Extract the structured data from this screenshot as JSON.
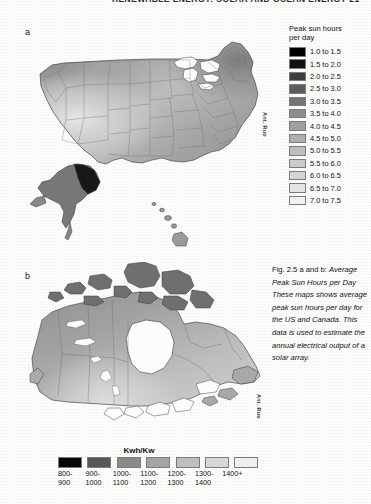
{
  "page": {
    "running_head": "RENEWABLE ENERGY: SOLAR AND OCEAN ENERGY   21",
    "panel_a_label": "a",
    "panel_b_label": "b",
    "attribution_a": "Ant. Ruo",
    "attribution_b": "Ant. Ruo"
  },
  "legend_a": {
    "title_line1": "Peak sun hours",
    "title_line2": "per day",
    "items": [
      {
        "label": "1.0 to 1.5",
        "color": "#000000"
      },
      {
        "label": "1.5 to 2.0",
        "color": "#111111"
      },
      {
        "label": "2.0 to 2.5",
        "color": "#3d3d3d"
      },
      {
        "label": "2.5 to 3.0",
        "color": "#5c5c5c"
      },
      {
        "label": "3.0 to 3.5",
        "color": "#767676"
      },
      {
        "label": "3.5 to 4.0",
        "color": "#8d8d8d"
      },
      {
        "label": "4.0 to 4.5",
        "color": "#a0a0a0"
      },
      {
        "label": "4.5 to 5.0",
        "color": "#b0b0b0"
      },
      {
        "label": "5.0 to 5.5",
        "color": "#bebebe"
      },
      {
        "label": "5.5 to 6.0",
        "color": "#cacaca"
      },
      {
        "label": "6.0 to 6.5",
        "color": "#d6d6d6"
      },
      {
        "label": "6.5 to 7.0",
        "color": "#e4e4e4"
      },
      {
        "label": "7.0 to 7.5",
        "color": "#f2f2f2"
      }
    ]
  },
  "legend_b": {
    "title": "Kwh/Kw",
    "items": [
      {
        "top": "800-",
        "bottom": "900",
        "color": "#060606"
      },
      {
        "top": "900-",
        "bottom": "1000",
        "color": "#575757"
      },
      {
        "top": "1000-",
        "bottom": "1100",
        "color": "#8a8a8a"
      },
      {
        "top": "1100-",
        "bottom": "1200",
        "color": "#a4a4a4"
      },
      {
        "top": "1200-",
        "bottom": "1300",
        "color": "#bfbfbf"
      },
      {
        "top": "1300-",
        "bottom": "1400",
        "color": "#d8d8d8"
      },
      {
        "top": "1400+",
        "bottom": "",
        "color": "#efefef"
      }
    ]
  },
  "caption": {
    "head": "Fig. 2.5 a and b:",
    "body": "Average Peak Sun Hours per Day These maps shows average peak sun hours per day for the US and Canada. This data is used to estimate the annual electrical output of a solar array."
  },
  "chart_data": {
    "type": "map",
    "title": "Average Peak Sun Hours per Day",
    "maps": [
      {
        "id": "a",
        "region": "United States",
        "variable": "Peak sun hours per day",
        "unit": "hours/day",
        "scale_min": 1.0,
        "scale_max": 7.5,
        "step": 0.5,
        "bins": [
          "1.0 to 1.5",
          "1.5 to 2.0",
          "2.0 to 2.5",
          "2.5 to 3.0",
          "3.0 to 3.5",
          "3.5 to 4.0",
          "4.0 to 4.5",
          "4.5 to 5.0",
          "5.0 to 5.5",
          "5.5 to 6.0",
          "6.0 to 6.5",
          "6.5 to 7.0",
          "7.0 to 7.5"
        ],
        "insets": [
          "Alaska",
          "Hawaii"
        ],
        "notes": "Highest values in the desert Southwest; lowest in Alaska and the Pacific Northwest."
      },
      {
        "id": "b",
        "region": "Canada",
        "variable": "Annual output",
        "unit": "Kwh/Kw",
        "bins": [
          "800-900",
          "900-1000",
          "1000-1100",
          "1100-1200",
          "1200-1300",
          "1300-1400",
          "1400+"
        ],
        "notes": "Highest values across the southern Prairies; lowest across the Arctic archipelago."
      }
    ]
  }
}
